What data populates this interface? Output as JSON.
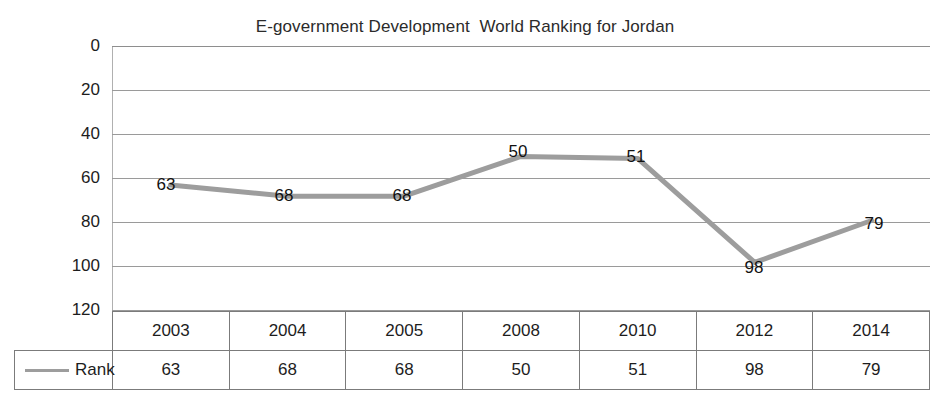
{
  "chart_data": {
    "type": "line",
    "title": "E-government Development  World Ranking for Jordan",
    "xlabel": "",
    "ylabel": "",
    "categories": [
      "2003",
      "2004",
      "2005",
      "2008",
      "2010",
      "2012",
      "2014"
    ],
    "series": [
      {
        "name": "Rank",
        "values": [
          63,
          68,
          68,
          50,
          51,
          98,
          79
        ],
        "color": "#9d9d9d"
      }
    ],
    "ylim": [
      0,
      120
    ],
    "y_inverted": true,
    "y_ticks": [
      "0",
      "20",
      "40",
      "60",
      "80",
      "100",
      "120"
    ],
    "grid": true,
    "legend_position": "data-table",
    "data_labels": [
      "63",
      "68",
      "68",
      "50",
      "51",
      "98",
      "79"
    ],
    "data_table": {
      "legend_label": "Rank",
      "header": [
        "2003",
        "2004",
        "2005",
        "2008",
        "2010",
        "2012",
        "2014"
      ],
      "row_values": [
        "63",
        "68",
        "68",
        "50",
        "51",
        "98",
        "79"
      ]
    }
  }
}
